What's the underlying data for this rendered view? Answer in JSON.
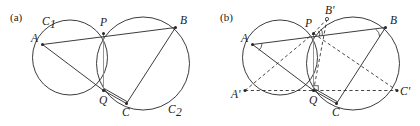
{
  "figure": {
    "kind": "geometry-diagram",
    "width": 420,
    "height": 126,
    "background_color": "#ffffff",
    "stroke_color": "#262626",
    "accent_gray": "#8a8a8a"
  },
  "panels": [
    {
      "id": "a",
      "label": "(a)",
      "label_pos": {
        "x": 10,
        "y": 21
      },
      "circles": [
        {
          "name": "C1",
          "cx": 70,
          "cy": 57.5,
          "r": 37.5
        },
        {
          "name": "C2",
          "cx": 143,
          "cy": 63.5,
          "r": 46.5
        }
      ],
      "points": [
        {
          "name": "A",
          "x": 42.5,
          "y": 44.5,
          "marker": "dot",
          "label": "A",
          "label_x": 31,
          "label_y": 42
        },
        {
          "name": "P",
          "x": 103.5,
          "y": 33.5,
          "marker": "dot",
          "label": "P",
          "label_x": 100,
          "label_y": 26
        },
        {
          "name": "B",
          "x": 175.5,
          "y": 27.5,
          "marker": "dot",
          "label": "B",
          "label_x": 180,
          "label_y": 24
        },
        {
          "name": "Q",
          "x": 103.5,
          "y": 90.5,
          "marker": "dot",
          "label": "Q",
          "label_x": 99,
          "label_y": 104
        },
        {
          "name": "C",
          "x": 126.5,
          "y": 103.5,
          "marker": "dot",
          "label": "C",
          "label_x": 122,
          "label_y": 116
        }
      ],
      "circle_labels": [
        {
          "name": "C1",
          "base": "C",
          "sub": "1",
          "x": 42,
          "y": 25
        },
        {
          "name": "C2",
          "base": "C",
          "sub": "2",
          "x": 168,
          "y": 113
        }
      ],
      "segments": [
        {
          "name": "A-P-B",
          "from": "A",
          "to": "B",
          "style": "solid"
        },
        {
          "name": "A-Q",
          "from": "A",
          "to": "Q",
          "style": "solid"
        },
        {
          "name": "Q-C",
          "from": "Q",
          "to": "C",
          "style": "solid"
        },
        {
          "name": "Q-C-2",
          "from": "Q",
          "to": "C",
          "style": "solid-offset"
        },
        {
          "name": "B-C",
          "from": "B",
          "to": "C",
          "style": "solid"
        },
        {
          "name": "P-Q",
          "from": "P",
          "to": "Q",
          "style": "gray"
        }
      ]
    },
    {
      "id": "b",
      "label": "(b)",
      "label_pos": {
        "x": 220,
        "y": 21
      },
      "circles": [
        {
          "name": "C1",
          "cx": 280,
          "cy": 57.5,
          "r": 37.5
        },
        {
          "name": "C2",
          "cx": 353,
          "cy": 63.5,
          "r": 46.5
        }
      ],
      "points": [
        {
          "name": "A",
          "x": 252.5,
          "y": 44.5,
          "marker": "dot",
          "label": "A",
          "label_x": 241,
          "label_y": 42
        },
        {
          "name": "P",
          "x": 313.5,
          "y": 33.5,
          "marker": "dot",
          "label": "P",
          "label_x": 305,
          "label_y": 27
        },
        {
          "name": "Bp",
          "x": 327.0,
          "y": 19.0,
          "marker": "open",
          "label": "B'",
          "label_x": 325,
          "label_y": 14
        },
        {
          "name": "B",
          "x": 385.5,
          "y": 27.5,
          "marker": "dot",
          "label": "B",
          "label_x": 390,
          "label_y": 24
        },
        {
          "name": "Ap",
          "x": 245.0,
          "y": 90.5,
          "marker": "dot",
          "label": "A'",
          "label_x": 231,
          "label_y": 98
        },
        {
          "name": "Q",
          "x": 313.5,
          "y": 90.5,
          "marker": "dot",
          "label": "Q",
          "label_x": 309,
          "label_y": 104
        },
        {
          "name": "Cp",
          "x": 397.0,
          "y": 90.5,
          "marker": "dot",
          "label": "C'",
          "label_x": 400,
          "label_y": 95
        },
        {
          "name": "C",
          "x": 336.5,
          "y": 103.5,
          "marker": "dot",
          "label": "C",
          "label_x": 332,
          "label_y": 116
        }
      ],
      "circle_labels": [],
      "segments": [
        {
          "name": "A-P-B",
          "from": "A",
          "to": "B",
          "style": "solid"
        },
        {
          "name": "A-Q",
          "from": "A",
          "to": "Q",
          "style": "solid"
        },
        {
          "name": "Q-C",
          "from": "Q",
          "to": "C",
          "style": "solid"
        },
        {
          "name": "Q-C-2",
          "from": "Q",
          "to": "C",
          "style": "solid-offset"
        },
        {
          "name": "B-C",
          "from": "B",
          "to": "C",
          "style": "solid"
        },
        {
          "name": "P-Q",
          "from": "P",
          "to": "Q",
          "style": "gray"
        },
        {
          "name": "Ap-Cp",
          "from": "Ap",
          "to": "Cp",
          "style": "dashed"
        },
        {
          "name": "Ap-P",
          "from": "Ap",
          "to": "P",
          "style": "dashed"
        },
        {
          "name": "P-Cp",
          "from": "P",
          "to": "Cp",
          "style": "dashed"
        },
        {
          "name": "Q-Bp",
          "from": "Q",
          "to": "Bp",
          "style": "dashed"
        },
        {
          "name": "P-Bp",
          "from": "P",
          "to": "Bp",
          "style": "dashed-short"
        }
      ],
      "angle_marks": [
        {
          "name": "angle-at-P-1",
          "at": "P"
        },
        {
          "name": "angle-at-P-2",
          "at": "P"
        },
        {
          "name": "angle-at-A",
          "at": "A"
        },
        {
          "name": "angle-at-B",
          "at": "B"
        }
      ],
      "right_angle_at": "Q"
    }
  ]
}
